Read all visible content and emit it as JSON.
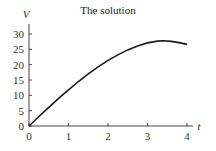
{
  "chart_data": {
    "type": "line",
    "title": "The solution",
    "xlabel": "t",
    "ylabel": "V",
    "xlim": [
      0,
      4.2
    ],
    "ylim": [
      0,
      32
    ],
    "xticks": [
      0,
      1,
      2,
      3,
      4
    ],
    "yticks": [
      0,
      5,
      10,
      15,
      20,
      25,
      30
    ],
    "grid": false,
    "legend": null,
    "series": [
      {
        "name": "V(t)",
        "color": "#1a1a1a",
        "x": [
          0,
          0.25,
          0.5,
          0.75,
          1.0,
          1.25,
          1.5,
          1.75,
          2.0,
          2.25,
          2.5,
          2.75,
          3.0,
          3.25,
          3.4,
          3.6,
          3.8,
          4.0
        ],
        "y": [
          0,
          3.1,
          6.1,
          9.0,
          11.8,
          14.5,
          17.0,
          19.3,
          21.4,
          23.2,
          24.8,
          26.1,
          27.1,
          27.7,
          27.8,
          27.6,
          27.2,
          26.6
        ]
      }
    ]
  }
}
